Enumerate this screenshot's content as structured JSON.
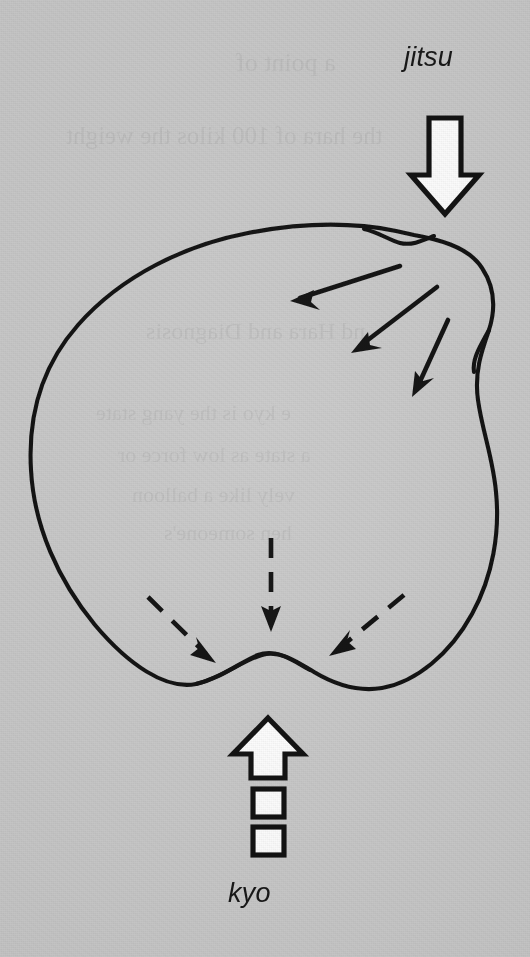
{
  "figure": {
    "background_color": "#c9c9c9",
    "ink_color": "#111111",
    "arrow_fill_color": "#ffffff",
    "title": "",
    "labels": {
      "top": "jitsu",
      "bottom": "kyo"
    },
    "ghost_text": [
      "a point of",
      "the hara of 100 kilos the weight",
      "nd Hara and Diagnosis",
      "e kyo is the yang state",
      "a state as low force or",
      "vely like a balloon",
      "hen someone's"
    ]
  },
  "diagram": {
    "type": "line-drawing",
    "shape": {
      "name": "hara-blob-outline",
      "stroke_width": 4,
      "description": "closed irregular blob with a notch on the right side and a raised hump in the bottom depression"
    },
    "outer_arrows": [
      {
        "name": "jitsu-pressure-arrow",
        "direction": "down",
        "style": "solid-outline-white",
        "x": 444,
        "y_start": 118,
        "y_end": 214
      },
      {
        "name": "kyo-pull-arrow",
        "direction": "up",
        "style": "dashed-outline-white",
        "x": 268,
        "y_start": 840,
        "y_end": 718,
        "segments": 2
      }
    ],
    "inner_solid_arrows": [
      {
        "name": "jitsu-flow-arrow-1",
        "x1": 400,
        "y1": 266,
        "x2": 292,
        "y2": 301
      },
      {
        "name": "jitsu-flow-arrow-2",
        "x1": 437,
        "y1": 287,
        "x2": 352,
        "y2": 352
      },
      {
        "name": "jitsu-flow-arrow-3",
        "x1": 448,
        "y1": 320,
        "x2": 412,
        "y2": 396
      }
    ],
    "inner_dashed_arrows": [
      {
        "name": "kyo-flow-arrow-left",
        "x1": 148,
        "y1": 597,
        "x2": 213,
        "y2": 661
      },
      {
        "name": "kyo-flow-arrow-center",
        "x1": 271,
        "y1": 538,
        "x2": 271,
        "y2": 628
      },
      {
        "name": "kyo-flow-arrow-right",
        "x1": 404,
        "y1": 595,
        "x2": 330,
        "y2": 654
      }
    ]
  }
}
